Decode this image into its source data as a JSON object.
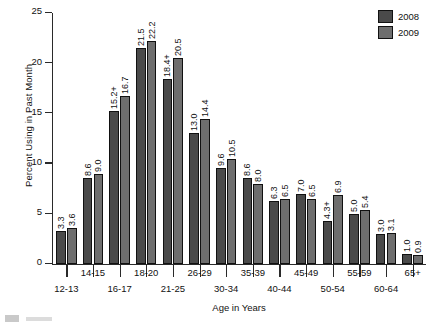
{
  "chart_data": {
    "type": "bar",
    "title": "",
    "xlabel": "Age in Years",
    "ylabel": "Percent Using in Past Month",
    "ylim": [
      0,
      25
    ],
    "yticks": [
      0,
      5,
      10,
      15,
      20,
      25
    ],
    "ytick_labels": [
      "0",
      "5",
      "10",
      "15",
      "20",
      "25"
    ],
    "grid": false,
    "legend_position": "top-right",
    "categories": [
      "12-13",
      "14-15",
      "16-17",
      "18-20",
      "21-25",
      "26-29",
      "30-34",
      "35-39",
      "40-44",
      "45-49",
      "50-54",
      "55-59",
      "60-64",
      "65+"
    ],
    "series": [
      {
        "name": "2008",
        "color": "#4a4a4a",
        "values": [
          3.3,
          8.6,
          15.2,
          21.5,
          18.4,
          13.0,
          9.6,
          8.6,
          6.3,
          7.0,
          4.3,
          5.0,
          3.0,
          1.0
        ],
        "labels": [
          "3.3",
          "8.6",
          "15.2+",
          "21.5",
          "18.4+",
          "13.0",
          "9.6",
          "8.6",
          "6.3",
          "7.0",
          "4.3+",
          "5.0",
          "3.0",
          "1.0"
        ]
      },
      {
        "name": "2009",
        "color": "#6e6e6e",
        "values": [
          3.6,
          9.0,
          16.7,
          22.2,
          20.5,
          14.4,
          10.5,
          8.0,
          6.5,
          6.5,
          6.9,
          5.4,
          3.1,
          0.9
        ],
        "labels": [
          "3.6",
          "9.0",
          "16.7",
          "22.2",
          "20.5",
          "14.4",
          "10.5",
          "8.0",
          "6.5",
          "6.5",
          "6.9",
          "5.4",
          "3.1",
          "0.9"
        ]
      }
    ]
  },
  "legend": {
    "items": [
      {
        "label": "2008",
        "color": "#4a4a4a"
      },
      {
        "label": "2009",
        "color": "#6e6e6e"
      }
    ]
  },
  "axes": {
    "y_title": "Percent Using in Past Month",
    "x_title": "Age in Years"
  }
}
